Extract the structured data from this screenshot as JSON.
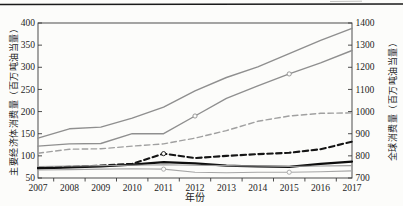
{
  "page": {
    "top_rule_color": "#1a1a1a",
    "background": "#fcfcfa"
  },
  "chart_data": {
    "type": "line",
    "title": "",
    "xlabel": "年份",
    "ylabel_left": "主要经济体消费量（百万吨油当量）",
    "ylabel_right": "全球消费量（百万吨油当量）",
    "x_categories": [
      "2007",
      "2008",
      "2009",
      "2010",
      "2011",
      "2012",
      "2013",
      "2014",
      "2015",
      "2016",
      "2017"
    ],
    "y_left": {
      "min": 50,
      "max": 400,
      "ticks": [
        400,
        350,
        300,
        250,
        200,
        150,
        100,
        50
      ]
    },
    "y_right": {
      "min": 700,
      "max": 1400,
      "ticks": [
        1400,
        1300,
        1200,
        1100,
        1000,
        900,
        800,
        700
      ]
    },
    "grid": false,
    "legend": "none",
    "axis_color": "#3a3a3a",
    "tick_label_color": "#1c1c1c",
    "series": [
      {
        "name": "gray-solid-upper",
        "color": "#8f8f8f",
        "style": "solid",
        "width": 1.4,
        "values": [
          140,
          161,
          165,
          185,
          210,
          247,
          277,
          301,
          331,
          361,
          388
        ],
        "marker_years": []
      },
      {
        "name": "gray-solid-lower",
        "color": "#8f8f8f",
        "style": "solid",
        "width": 1.4,
        "values": [
          122,
          127,
          128,
          150,
          150,
          190,
          230,
          258,
          285,
          310,
          338
        ],
        "marker_years": [
          "2012",
          "2015"
        ]
      },
      {
        "name": "gray-dashed",
        "color": "#a0a0a0",
        "style": "dashed",
        "width": 1.4,
        "values": [
          106,
          115,
          116,
          122,
          127,
          140,
          157,
          178,
          190,
          196,
          197
        ],
        "marker_years": []
      },
      {
        "name": "black-dashed",
        "color": "#151515",
        "style": "dashed",
        "width": 2.1,
        "values": [
          73,
          75,
          78,
          82,
          105,
          95,
          100,
          104,
          107,
          115,
          132
        ],
        "marker_years": [
          "2011"
        ]
      },
      {
        "name": "black-solid",
        "color": "#0d0d0d",
        "style": "solid",
        "width": 2.2,
        "values": [
          72,
          74,
          76,
          80,
          86,
          83,
          78,
          76,
          75,
          82,
          87
        ],
        "marker_years": []
      },
      {
        "name": "gray-thin-upper",
        "color": "#9a9a9a",
        "style": "solid",
        "width": 1.1,
        "values": [
          76,
          77,
          78,
          79,
          80,
          79,
          78,
          77,
          76,
          77,
          78
        ],
        "marker_years": []
      },
      {
        "name": "gray-thin-lower",
        "color": "#a6a6a6",
        "style": "solid",
        "width": 1.1,
        "values": [
          68,
          69,
          70,
          71,
          70,
          63,
          62,
          63,
          63,
          64,
          66
        ],
        "marker_years": [
          "2011",
          "2015"
        ]
      }
    ]
  }
}
